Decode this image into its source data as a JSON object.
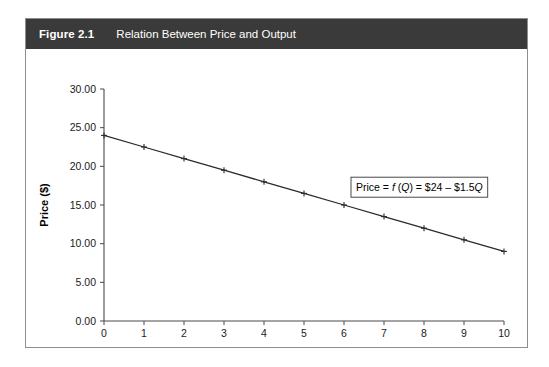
{
  "figure": {
    "number": "Figure 2.1",
    "caption": "Relation Between Price and Output",
    "header_color": "#3a3a3a",
    "border_color": "#8e8e8e"
  },
  "chart_data": {
    "type": "line",
    "title": "Relation Between Price and Output",
    "xlabel": "Output per time period (000 units)",
    "ylabel": "Price ($)",
    "x": [
      0,
      1,
      2,
      3,
      4,
      5,
      6,
      7,
      8,
      9,
      10
    ],
    "values": [
      24.0,
      22.5,
      21.0,
      19.5,
      18.0,
      16.5,
      15.0,
      13.5,
      12.0,
      10.5,
      9.0
    ],
    "series": [
      {
        "name": "Price = f(Q) = $24 - $1.5Q",
        "values": [
          24.0,
          22.5,
          21.0,
          19.5,
          18.0,
          16.5,
          15.0,
          13.5,
          12.0,
          10.5,
          9.0
        ]
      }
    ],
    "xlim": [
      0,
      10
    ],
    "ylim": [
      0,
      30
    ],
    "xticks": [
      "0",
      "1",
      "2",
      "3",
      "4",
      "5",
      "6",
      "7",
      "8",
      "9",
      "10"
    ],
    "yticks": [
      "0.00",
      "5.00",
      "10.00",
      "15.00",
      "20.00",
      "25.00",
      "30.00"
    ],
    "ytick_values": [
      0,
      5,
      10,
      15,
      20,
      25,
      30
    ],
    "grid": false,
    "legend": "none",
    "marker": "plus",
    "line_color": "#2b2b2b",
    "annotations": [
      {
        "name": "equation-box",
        "parts": [
          {
            "text": "Price = ",
            "style": "normal"
          },
          {
            "text": "f",
            "style": "italic"
          },
          {
            "text": " (",
            "style": "normal"
          },
          {
            "text": "Q",
            "style": "italic"
          },
          {
            "text": ") = $24 – $1.5",
            "style": "normal"
          },
          {
            "text": "Q",
            "style": "italic"
          }
        ],
        "plain": "Price = f (Q) = $24 – $1.5Q",
        "x": 6.3,
        "y": 17.3
      }
    ]
  }
}
